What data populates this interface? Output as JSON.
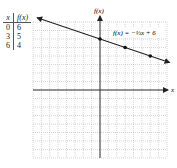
{
  "table": {
    "headers": [
      "x",
      "f(x)"
    ],
    "rows": [
      [
        "0",
        "6"
      ],
      [
        "3",
        "5"
      ],
      [
        "6",
        "4"
      ]
    ]
  },
  "graph": {
    "y_axis_label": "f(x)",
    "x_axis_label": "x",
    "equation_label": "f(x) = −⅓x + 6",
    "line_color": "#222222",
    "grid_color": "#bbbbbb"
  },
  "chart_data": {
    "type": "line",
    "title": "",
    "xlabel": "x",
    "ylabel": "f(x)",
    "xlim": [
      -8,
      8
    ],
    "ylim": [
      -8,
      8
    ],
    "grid": true,
    "series": [
      {
        "name": "f(x) = -1/3 x + 6",
        "x": [
          -8,
          0,
          3,
          6,
          8
        ],
        "y": [
          8.67,
          6,
          5,
          4,
          3.33
        ]
      }
    ],
    "points": [
      {
        "x": 0,
        "y": 6
      },
      {
        "x": 3,
        "y": 5
      },
      {
        "x": 6,
        "y": 4
      }
    ],
    "annotations": [
      "f(x) = -1/3 x + 6"
    ]
  }
}
